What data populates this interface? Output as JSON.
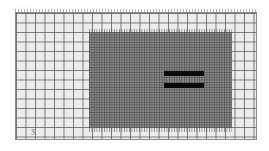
{
  "figure": {
    "type": "mesh-grid-scan",
    "top_label": "· · · · · ·",
    "corner_mark": "ʒ",
    "regions": {
      "outer_grid": {
        "x": 15,
        "y": 12,
        "w": 242,
        "h": 128,
        "fill": "#ececec",
        "line": "#505050"
      },
      "refined_region": {
        "x": 89,
        "y": 32,
        "w": 143,
        "h": 96,
        "fill": "#8c8c8c"
      }
    },
    "bars": [
      {
        "x": 164,
        "y": 71,
        "w": 40,
        "h": 5,
        "color": "#0a0a0a"
      },
      {
        "x": 164,
        "y": 83,
        "w": 40,
        "h": 5,
        "color": "#0a0a0a"
      }
    ]
  }
}
